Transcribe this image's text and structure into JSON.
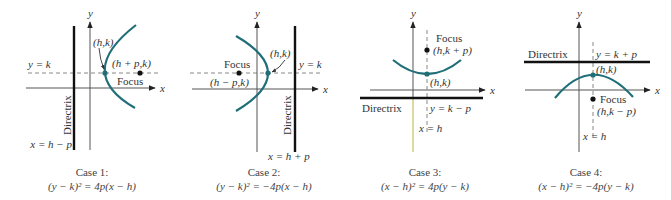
{
  "figure": {
    "colors": {
      "curve": "#1f6e78",
      "vertex_dot": "#1f6e78",
      "focus_dot": "#111111",
      "directrix": "#111111",
      "axis": "#555555",
      "case3_lower_y_axis": "#c8c060"
    },
    "panels": [
      {
        "id": "case-1",
        "axis_labels": {
          "x": "x",
          "y": "y"
        },
        "line_label": "y = k",
        "vertex_label": "(h,k)",
        "focus_point_label": "(h + p,k)",
        "focus_label": "Focus",
        "directrix_label": "Directrix",
        "directrix_eq": "x = h − p",
        "caption_title": "Case 1:",
        "caption_eq": "(y − k)² = 4p(x − h)",
        "opens": "right"
      },
      {
        "id": "case-2",
        "axis_labels": {
          "x": "x",
          "y": "y"
        },
        "line_label": "y = k",
        "vertex_label": "(h,k)",
        "focus_point_label": "(h − p,k)",
        "focus_label": "Focus",
        "directrix_label": "Directrix",
        "directrix_eq": "x = h + p",
        "caption_title": "Case 2:",
        "caption_eq": "(y − k)² = −4p(x − h)",
        "opens": "left"
      },
      {
        "id": "case-3",
        "axis_labels": {
          "x": "x",
          "y": "y"
        },
        "line_label": "x = h",
        "vertex_label": "(h,k)",
        "focus_point_label": "(h,k + p)",
        "focus_label": "Focus",
        "directrix_label": "Directrix",
        "directrix_eq": "y = k − p",
        "caption_title": "Case 3:",
        "caption_eq": "(x − h)² = 4p(y − k)",
        "opens": "up"
      },
      {
        "id": "case-4",
        "axis_labels": {
          "x": "x",
          "y": "y"
        },
        "line_label": "x = h",
        "vertex_label": "(h,k)",
        "focus_point_label": "(h,k − p)",
        "focus_label": "Focus",
        "directrix_label": "Directrix",
        "directrix_eq": "y = k + p",
        "caption_title": "Case 4:",
        "caption_eq": "(x − h)² = −4p(y − k)",
        "opens": "down"
      }
    ]
  }
}
